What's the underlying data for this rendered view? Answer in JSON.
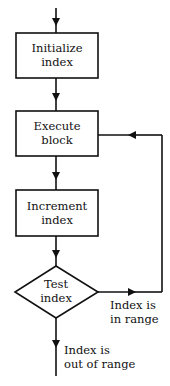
{
  "diagram": {
    "type": "flowchart",
    "nodes": [
      {
        "id": "init",
        "shape": "rect",
        "line1": "Initialize",
        "line2": "index"
      },
      {
        "id": "exec",
        "shape": "rect",
        "line1": "Execute",
        "line2": "block"
      },
      {
        "id": "incr",
        "shape": "rect",
        "line1": "Increment",
        "line2": "index"
      },
      {
        "id": "test",
        "shape": "diamond",
        "line1": "Test",
        "line2": "index"
      }
    ],
    "edges": [
      {
        "from": "start",
        "to": "init"
      },
      {
        "from": "init",
        "to": "exec"
      },
      {
        "from": "exec",
        "to": "incr"
      },
      {
        "from": "incr",
        "to": "test"
      },
      {
        "from": "test",
        "to": "exec",
        "label": "Index is in range"
      },
      {
        "from": "test",
        "to": "end",
        "label": "Index is out of range"
      }
    ],
    "labels": {
      "in_range_1": "Index is",
      "in_range_2": "in range",
      "out_range_1": "Index is",
      "out_range_2": "out of range"
    },
    "colors": {
      "stroke": "#111111",
      "background": "#ffffff"
    }
  }
}
